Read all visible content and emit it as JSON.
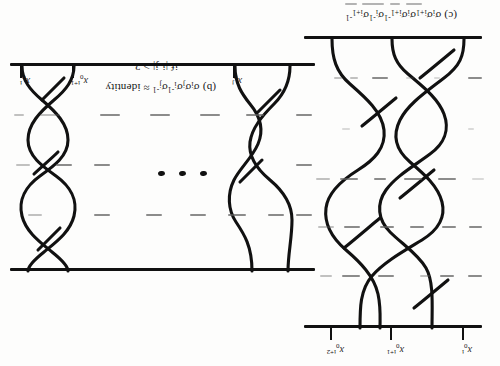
{
  "figure": {
    "orientation": "rotated-180",
    "background_color": "#fdfdfc",
    "ink_color": "#111111"
  },
  "panel_c": {
    "caption_prefix": "(c)",
    "caption_formula": "σiσi+1σiσi+1⁻¹σi⁻¹σi+1⁻¹",
    "caption_tokens": [
      {
        "base": "(c)"
      },
      {
        "base": "σ",
        "sub": "i"
      },
      {
        "base": "σ",
        "sub": "i+1"
      },
      {
        "base": "σ",
        "sub": "i"
      },
      {
        "base": "σ",
        "sub": "i+1",
        "sup": "-1"
      },
      {
        "base": "σ",
        "sub": "i",
        "sup": "-1"
      },
      {
        "base": "σ",
        "sub": "i+1",
        "sup": "-1"
      }
    ],
    "strand_labels": [
      {
        "base": "x",
        "sub": "0",
        "sup": "i"
      },
      {
        "base": "x",
        "sub": "0",
        "sup": "i+1"
      },
      {
        "base": "x",
        "sub": "0",
        "sup": "i+2"
      }
    ],
    "strand_count": 3,
    "crossing_count": 6
  },
  "panel_b": {
    "caption_prefix": "(b)",
    "caption_formula": "σiσjσi⁻¹σj⁻¹ ≈ identity",
    "caption_tokens": [
      {
        "base": "(b)"
      },
      {
        "base": "σ",
        "sub": "i"
      },
      {
        "base": "σ",
        "sub": "j"
      },
      {
        "base": "σ",
        "sub": "i",
        "sup": "-1"
      },
      {
        "base": "σ",
        "sub": "j",
        "sup": "-1"
      }
    ],
    "caption_relation": "≈ identity",
    "condition": "if |i-j| > 2",
    "ellipsis": "• • •",
    "strand_labels": [
      {
        "base": "x",
        "sub": "0",
        "sup": "i"
      },
      {
        "base": "x",
        "sub": "0",
        "sup": "i+1"
      },
      {
        "base": "x",
        "sub": "0",
        "sup": "j"
      }
    ],
    "left_group_crossings": 2,
    "right_group_crossings": 3
  }
}
